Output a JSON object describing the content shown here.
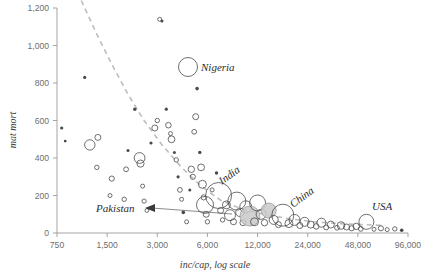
{
  "chart_data": {
    "type": "scatter",
    "title": "",
    "subtitle": "",
    "xlabel": "inc/cap, log scale",
    "ylabel": "mat mort",
    "xscale": "log",
    "xlim": [
      750,
      96000
    ],
    "ylim": [
      0,
      1200
    ],
    "grid": false,
    "legend": "none",
    "xticks": [
      "750",
      "1,500",
      "3,000",
      "6,000",
      "12,000",
      "24,000",
      "48,000",
      "96,000"
    ],
    "xtick_values": [
      750,
      1500,
      3000,
      6000,
      12000,
      24000,
      48000,
      96000
    ],
    "yticks": [
      "0",
      "200",
      "400",
      "600",
      "800",
      "1,000",
      "1,200"
    ],
    "ytick_values": [
      0,
      200,
      400,
      600,
      800,
      1000,
      1200
    ],
    "annotations": [
      {
        "label": "Nigeria",
        "x": 5700,
        "y": 915,
        "style": "bubble-legend"
      },
      {
        "label": "Pakistan",
        "x": 2400,
        "y": 150,
        "style": "arrow-left"
      },
      {
        "label": "India",
        "x": 9000,
        "y": 330,
        "style": "rotated"
      },
      {
        "label": "China",
        "x": 20000,
        "y": 210,
        "style": "rotated"
      },
      {
        "label": "USA",
        "x": 58000,
        "y": 110,
        "style": "plain"
      }
    ],
    "trend_line": {
      "style": "dashed",
      "color": "#bdbdbd",
      "points": [
        [
          1050,
          1240
        ],
        [
          1300,
          1060
        ],
        [
          1600,
          900
        ],
        [
          2000,
          740
        ],
        [
          2500,
          600
        ],
        [
          3200,
          470
        ],
        [
          4200,
          350
        ],
        [
          5500,
          250
        ],
        [
          7200,
          175
        ],
        [
          9500,
          130
        ],
        [
          13000,
          100
        ],
        [
          18000,
          78
        ],
        [
          26000,
          60
        ],
        [
          40000,
          48
        ],
        [
          70000,
          40
        ]
      ]
    },
    "points": [
      {
        "x": 800,
        "y": 560,
        "r": 1.6
      },
      {
        "x": 840,
        "y": 490,
        "r": 1.4
      },
      {
        "x": 1100,
        "y": 830,
        "r": 1.6
      },
      {
        "x": 1180,
        "y": 470,
        "r": 5.2
      },
      {
        "x": 1320,
        "y": 510,
        "r": 3.0
      },
      {
        "x": 1300,
        "y": 350,
        "r": 2.2
      },
      {
        "x": 1600,
        "y": 290,
        "r": 2.6
      },
      {
        "x": 1560,
        "y": 200,
        "r": 2.0
      },
      {
        "x": 1900,
        "y": 180,
        "r": 2.2
      },
      {
        "x": 1950,
        "y": 340,
        "r": 2.4
      },
      {
        "x": 2000,
        "y": 440,
        "r": 1.5
      },
      {
        "x": 2200,
        "y": 660,
        "r": 1.7
      },
      {
        "x": 2350,
        "y": 400,
        "r": 5.4
      },
      {
        "x": 2380,
        "y": 370,
        "r": 3.6
      },
      {
        "x": 2450,
        "y": 250,
        "r": 2.0
      },
      {
        "x": 2500,
        "y": 170,
        "r": 2.1
      },
      {
        "x": 2600,
        "y": 120,
        "r": 1.9
      },
      {
        "x": 2750,
        "y": 480,
        "r": 1.6
      },
      {
        "x": 2900,
        "y": 560,
        "r": 3.0
      },
      {
        "x": 3000,
        "y": 600,
        "r": 2.2
      },
      {
        "x": 3100,
        "y": 1140,
        "r": 2.0
      },
      {
        "x": 3200,
        "y": 1130,
        "r": 1.5
      },
      {
        "x": 3400,
        "y": 660,
        "r": 1.6
      },
      {
        "x": 3500,
        "y": 575,
        "r": 2.8
      },
      {
        "x": 3600,
        "y": 530,
        "r": 2.0
      },
      {
        "x": 3650,
        "y": 500,
        "r": 3.4
      },
      {
        "x": 3800,
        "y": 430,
        "r": 1.5
      },
      {
        "x": 3900,
        "y": 390,
        "r": 2.2
      },
      {
        "x": 4000,
        "y": 300,
        "r": 1.6
      },
      {
        "x": 4100,
        "y": 230,
        "r": 2.4
      },
      {
        "x": 4200,
        "y": 180,
        "r": 2.0
      },
      {
        "x": 4300,
        "y": 110,
        "r": 1.8
      },
      {
        "x": 4500,
        "y": 60,
        "r": 2.0
      },
      {
        "x": 4700,
        "y": 230,
        "r": 1.5
      },
      {
        "x": 4800,
        "y": 340,
        "r": 3.2
      },
      {
        "x": 4900,
        "y": 300,
        "r": 2.6
      },
      {
        "x": 5000,
        "y": 540,
        "r": 2.4
      },
      {
        "x": 5100,
        "y": 620,
        "r": 3.0
      },
      {
        "x": 5200,
        "y": 770,
        "r": 1.8
      },
      {
        "x": 5400,
        "y": 430,
        "r": 1.7
      },
      {
        "x": 5500,
        "y": 350,
        "r": 3.4
      },
      {
        "x": 5600,
        "y": 260,
        "r": 4.0
      },
      {
        "x": 5700,
        "y": 190,
        "r": 2.6
      },
      {
        "x": 5800,
        "y": 150,
        "r": 8.5
      },
      {
        "x": 5900,
        "y": 100,
        "r": 3.0
      },
      {
        "x": 6000,
        "y": 60,
        "r": 2.2
      },
      {
        "x": 6400,
        "y": 230,
        "r": 2.0
      },
      {
        "x": 6800,
        "y": 320,
        "r": 1.7
      },
      {
        "x": 7000,
        "y": 200,
        "r": 13.0
      },
      {
        "x": 7200,
        "y": 120,
        "r": 3.0
      },
      {
        "x": 7400,
        "y": 70,
        "r": 2.2
      },
      {
        "x": 7800,
        "y": 150,
        "r": 4.0
      },
      {
        "x": 8200,
        "y": 95,
        "r": 5.5
      },
      {
        "x": 8600,
        "y": 60,
        "r": 3.0
      },
      {
        "x": 9000,
        "y": 170,
        "r": 9.0
      },
      {
        "x": 9400,
        "y": 110,
        "r": 4.2
      },
      {
        "x": 9800,
        "y": 55,
        "r": 3.0
      },
      {
        "x": 10200,
        "y": 140,
        "r": 6.0
      },
      {
        "x": 10800,
        "y": 90,
        "r": 10.0,
        "filled": true
      },
      {
        "x": 11500,
        "y": 60,
        "r": 4.0
      },
      {
        "x": 12000,
        "y": 160,
        "r": 8.0
      },
      {
        "x": 12600,
        "y": 100,
        "r": 5.0
      },
      {
        "x": 13200,
        "y": 55,
        "r": 3.2
      },
      {
        "x": 14000,
        "y": 120,
        "r": 7.5,
        "filled": true
      },
      {
        "x": 15000,
        "y": 70,
        "r": 4.5
      },
      {
        "x": 16000,
        "y": 45,
        "r": 3.0
      },
      {
        "x": 17000,
        "y": 95,
        "r": 11.0
      },
      {
        "x": 18500,
        "y": 50,
        "r": 4.0
      },
      {
        "x": 20000,
        "y": 70,
        "r": 5.5
      },
      {
        "x": 21500,
        "y": 40,
        "r": 3.0
      },
      {
        "x": 23000,
        "y": 60,
        "r": 4.5
      },
      {
        "x": 25000,
        "y": 45,
        "r": 3.5
      },
      {
        "x": 27000,
        "y": 35,
        "r": 2.8
      },
      {
        "x": 29000,
        "y": 55,
        "r": 4.5
      },
      {
        "x": 31000,
        "y": 30,
        "r": 2.5
      },
      {
        "x": 33000,
        "y": 45,
        "r": 3.5
      },
      {
        "x": 36000,
        "y": 28,
        "r": 2.4
      },
      {
        "x": 38000,
        "y": 40,
        "r": 3.8
      },
      {
        "x": 41000,
        "y": 32,
        "r": 3.0
      },
      {
        "x": 44000,
        "y": 25,
        "r": 2.6
      },
      {
        "x": 47000,
        "y": 35,
        "r": 3.2
      },
      {
        "x": 50000,
        "y": 22,
        "r": 2.4
      },
      {
        "x": 54000,
        "y": 60,
        "r": 7.5
      },
      {
        "x": 60000,
        "y": 20,
        "r": 2.0
      },
      {
        "x": 66000,
        "y": 25,
        "r": 2.6
      },
      {
        "x": 72000,
        "y": 18,
        "r": 2.0
      },
      {
        "x": 80000,
        "y": 22,
        "r": 2.2
      },
      {
        "x": 88000,
        "y": 15,
        "r": 1.8
      }
    ]
  }
}
